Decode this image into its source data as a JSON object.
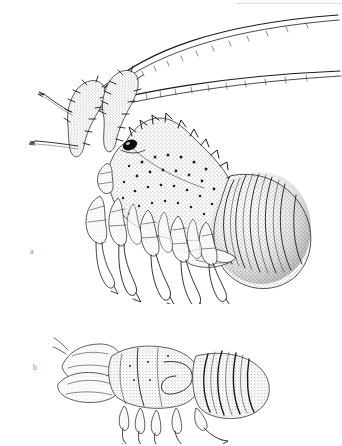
{
  "page": {
    "background_color": "#ffffff",
    "header": {
      "running_head_text": "LOBSTERS",
      "rule_color": "#dddde1",
      "visible": "cut off at top edge"
    }
  },
  "figure": {
    "kind": "scientific-illustration-plate",
    "medium": "stipple-and-line ink drawing",
    "ink_color": "#1b1b1b",
    "panels": [
      {
        "id": "a",
        "label": "a",
        "subject": "spiny lobster",
        "features": [
          "two very long segmented antennae sweeping to upper right",
          "spiny antennular plate and rostral horns",
          "large dark compound eye",
          "heavily stippled carapace with tubercles and spines",
          "curved segmented abdomen of six somites",
          "five pairs of walking legs with pointed dactyls",
          "tail fan partly tucked beneath abdomen"
        ]
      },
      {
        "id": "b",
        "label": "b",
        "subject": "slipper lobster",
        "features": [
          "flattened broad plate-like antennae at front",
          "squat depressed carapace",
          "smooth banded abdominal segments",
          "short walking legs with curved dactyls"
        ]
      }
    ]
  }
}
